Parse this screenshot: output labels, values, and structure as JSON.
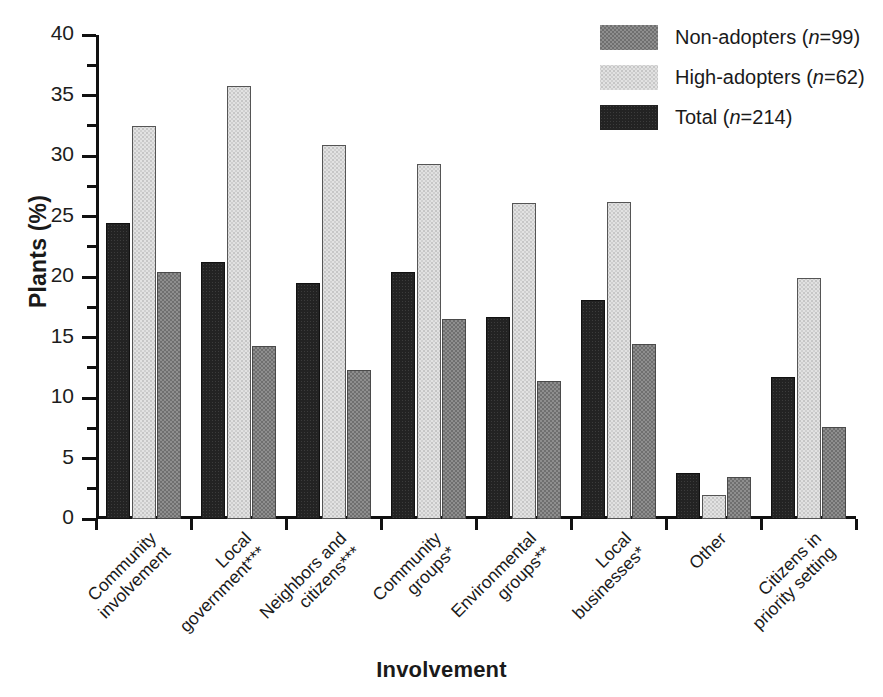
{
  "chart_data": {
    "type": "bar",
    "title": "",
    "xlabel": "Involvement",
    "ylabel": "Plants (%)",
    "ylim": [
      0,
      40
    ],
    "ytick_labels": [
      "0",
      "5",
      "10",
      "15",
      "20",
      "25",
      "30",
      "35",
      "40"
    ],
    "ytick_values": [
      0,
      5,
      10,
      15,
      20,
      25,
      30,
      35,
      40
    ],
    "minor_tick_interval": 2.5,
    "grid": false,
    "legend_position": "top-right",
    "categories": [
      "Community involvement",
      "Local government***",
      "Neighbors and citizens***",
      "Community groups*",
      "Environmental groups**",
      "Local businesses*",
      "Other",
      "Citizens in priority setting"
    ],
    "category_lines": [
      [
        "Community",
        "involvement"
      ],
      [
        "Local",
        "government***"
      ],
      [
        "Neighbors and",
        "citizens***"
      ],
      [
        "Community",
        "groups*"
      ],
      [
        "Environmental",
        "groups**"
      ],
      [
        "Local",
        "businesses*"
      ],
      [
        "Other",
        ""
      ],
      [
        "Citizens in",
        "priority setting"
      ]
    ],
    "series": [
      {
        "name": "Total (n=214)",
        "key": "total",
        "fill": "solid-dark",
        "color": "#232323",
        "values": [
          24.5,
          21.2,
          19.5,
          20.4,
          16.7,
          18.1,
          3.8,
          11.7
        ]
      },
      {
        "name": "High-adopters (n=62)",
        "key": "high",
        "fill": "light-dotted",
        "color": "#e2e2e2",
        "values": [
          32.5,
          35.8,
          30.9,
          29.3,
          26.1,
          26.2,
          2.0,
          19.9
        ]
      },
      {
        "name": "Non-adopters (n=99)",
        "key": "non",
        "fill": "gray-hatch",
        "color": "#8e8e8e",
        "values": [
          20.4,
          14.3,
          12.3,
          16.5,
          11.4,
          14.5,
          3.5,
          7.6
        ]
      }
    ],
    "bar_order_in_group": [
      "total",
      "high",
      "non"
    ]
  },
  "legend": {
    "items": [
      {
        "label_prefix": "Non-adopters (",
        "label_n": "n",
        "label_suffix": "=99)",
        "swatch": "gray-hatch"
      },
      {
        "label_prefix": "High-adopters (",
        "label_n": "n",
        "label_suffix": "=62)",
        "swatch": "light-dotted"
      },
      {
        "label_prefix": "Total (",
        "label_n": "n",
        "label_suffix": "=214)",
        "swatch": "solid-dark"
      }
    ]
  },
  "axis_titles": {
    "y": "Plants (%)",
    "x": "Involvement"
  }
}
